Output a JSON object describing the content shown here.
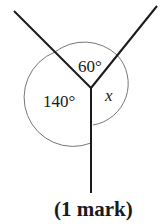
{
  "diagram": {
    "type": "angles-at-a-point",
    "labels": {
      "top_angle": "60°",
      "left_angle": "140°",
      "right_angle": "x"
    },
    "lines": 3,
    "colors": {
      "lines": "#1a1a1a",
      "arc": "#777777"
    }
  },
  "footer": {
    "marks": "(1 mark)"
  }
}
